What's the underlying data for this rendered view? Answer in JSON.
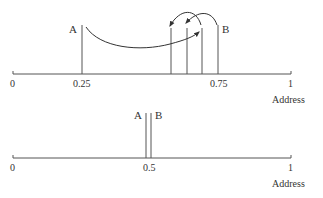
{
  "colors": {
    "line": "#555555",
    "text": "#333333",
    "background": "#ffffff"
  },
  "panels": [
    {
      "name": "spread-accesses",
      "axis": {
        "ticks": [
          {
            "label": "0",
            "value": 0
          },
          {
            "label": "0.25",
            "value": 0.25
          },
          {
            "label": "0.75",
            "value": 0.75
          },
          {
            "label": "1",
            "value": 1
          }
        ],
        "xlabel": "Address"
      },
      "markers": [
        {
          "label": "A",
          "value": 0.25
        },
        {
          "label": "B",
          "value": 0.74
        }
      ],
      "intermediate_lines": [
        0.57,
        0.62,
        0.68
      ],
      "arrows": [
        {
          "from": 0.25,
          "to": 0.68,
          "description": "long jump from A"
        },
        {
          "from": 0.74,
          "to": 0.62,
          "description": "backward hop from B"
        },
        {
          "from": 0.68,
          "to": 0.57,
          "description": "backward hop"
        }
      ]
    },
    {
      "name": "clustered-accesses",
      "axis": {
        "ticks": [
          {
            "label": "0",
            "value": 0
          },
          {
            "label": "0.5",
            "value": 0.5
          },
          {
            "label": "1",
            "value": 1
          }
        ],
        "xlabel": "Address"
      },
      "markers": [
        {
          "label": "A",
          "value": 0.49
        },
        {
          "label": "B",
          "value": 0.51
        }
      ]
    }
  ]
}
